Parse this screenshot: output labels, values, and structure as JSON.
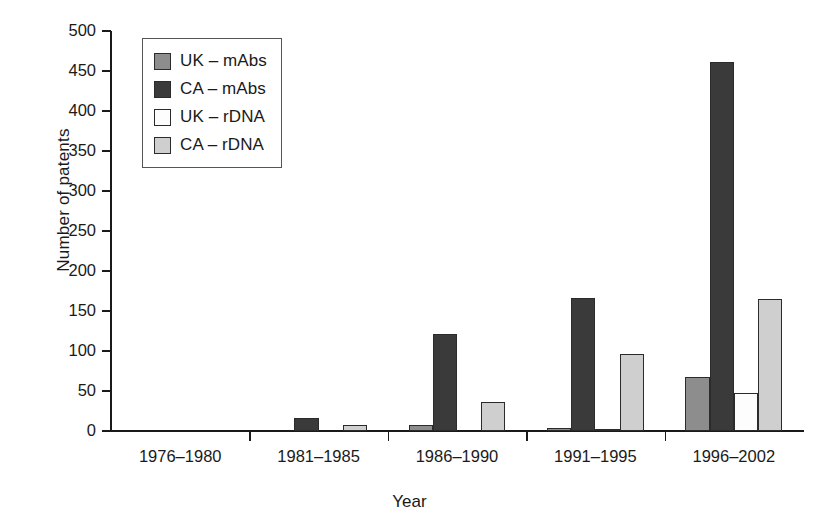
{
  "chart_data": {
    "type": "bar",
    "title": "",
    "xlabel": "Year",
    "ylabel": "Number of patents",
    "categories": [
      "1976–1980",
      "1981–1985",
      "1986–1990",
      "1991–1995",
      "1996–2002"
    ],
    "series": [
      {
        "name": "UK – mAbs",
        "color": "#8d8d8d",
        "values": [
          0,
          0,
          8,
          4,
          68
        ]
      },
      {
        "name": "CA – mAbs",
        "color": "#3a3a3a",
        "values": [
          0,
          16,
          121,
          166,
          461
        ]
      },
      {
        "name": "UK – rDNA",
        "color": "#fdfdfd",
        "values": [
          0,
          0,
          0,
          3,
          47
        ]
      },
      {
        "name": "CA – rDNA",
        "color": "#cfcfcf",
        "values": [
          0,
          7,
          36,
          96,
          165
        ]
      }
    ],
    "ylim": [
      0,
      500
    ],
    "yticks": [
      0,
      50,
      100,
      150,
      200,
      250,
      300,
      350,
      400,
      450,
      500
    ],
    "ytick_labels": [
      "0",
      "50",
      "100",
      "150",
      "200",
      "250",
      "300",
      "350",
      "400",
      "450",
      "500"
    ],
    "grid": false,
    "legend_position": "top-left"
  }
}
